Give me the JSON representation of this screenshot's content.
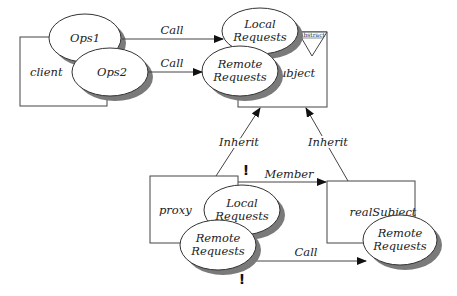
{
  "diagram": {
    "colors": {
      "line": "#444444",
      "shadow": "#7a7a7a",
      "fill": "#ffffff",
      "text": "#222222"
    },
    "classes": {
      "client": {
        "label": "client",
        "operations": [
          "Ops1",
          "Ops2"
        ]
      },
      "subject": {
        "label": "subject",
        "badge": "Abstract",
        "operations": [
          "Local\nRequests",
          "Remote\nRequests"
        ],
        "op_lines": [
          [
            "Local",
            "Requests"
          ],
          [
            "Remote",
            "Requests"
          ]
        ]
      },
      "proxy": {
        "label": "proxy",
        "op_lines": [
          [
            "Local",
            "Requests"
          ],
          [
            "Remote",
            "Requests"
          ]
        ]
      },
      "realSubject": {
        "label": "realSubject",
        "op_lines": [
          [
            "Remote",
            "Requests"
          ]
        ]
      }
    },
    "edges": [
      {
        "from": "client.Ops1",
        "to": "subject.LocalRequests",
        "label": "Call"
      },
      {
        "from": "client.Ops2",
        "to": "subject.RemoteRequests",
        "label": "Call"
      },
      {
        "from": "proxy",
        "to": "subject",
        "label": "Inherit"
      },
      {
        "from": "realSubject",
        "to": "subject",
        "label": "Inherit"
      },
      {
        "from": "proxy",
        "to": "realSubject",
        "label": "Member"
      },
      {
        "from": "proxy.RemoteRequests",
        "to": "realSubject.RemoteRequests",
        "label": "Call"
      }
    ],
    "markers": [
      "!",
      "!"
    ]
  }
}
